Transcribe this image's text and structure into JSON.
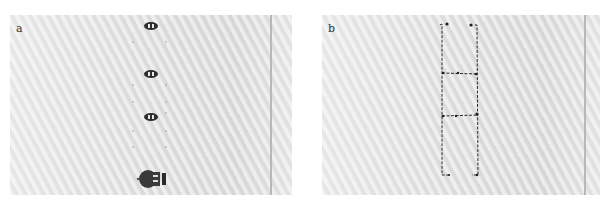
{
  "panels": [
    {
      "label": "a",
      "description": "Paper sheet with three small oval robots arranged vertically along a faint dotted guide track and a larger robot at the bottom",
      "objects": {
        "small_robots": 3,
        "large_robot": 1,
        "dotted_guide_columns": 2
      }
    },
    {
      "label": "b",
      "description": "Paper sheet showing a hand-drawn-looking ladder pattern of three stacked rectangles traced in dark ink",
      "objects": {
        "rectangles": 3
      }
    }
  ],
  "colors": {
    "paper": "#dcdcdc",
    "ink": "#2a2a2a",
    "label": "#333333"
  }
}
